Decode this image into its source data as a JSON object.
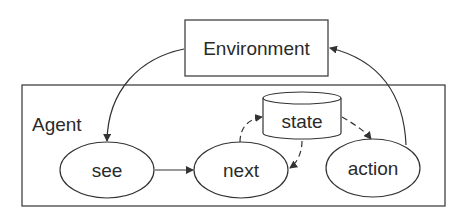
{
  "diagram": {
    "environment": {
      "label": "Environment"
    },
    "agent": {
      "label": "Agent"
    },
    "nodes": {
      "see": {
        "label": "see"
      },
      "next": {
        "label": "next"
      },
      "state": {
        "label": "state"
      },
      "action": {
        "label": "action"
      }
    },
    "edges": [
      {
        "from": "Environment",
        "to": "see",
        "style": "solid"
      },
      {
        "from": "see",
        "to": "next",
        "style": "solid"
      },
      {
        "from": "next",
        "to": "state",
        "style": "dashed"
      },
      {
        "from": "state",
        "to": "next",
        "style": "dashed"
      },
      {
        "from": "state",
        "to": "action",
        "style": "dashed"
      },
      {
        "from": "action",
        "to": "Environment",
        "style": "solid"
      }
    ]
  }
}
